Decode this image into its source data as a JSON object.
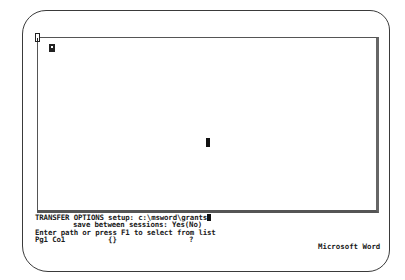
{
  "app": {
    "name": "Microsoft Word"
  },
  "command": {
    "menu": "TRANSFER OPTIONS",
    "field1_label": "setup:",
    "field1_value": "c:\\msword\\grants",
    "field2_label": "save between sessions:",
    "field2_value": "Yes(No)"
  },
  "message": "Enter path or press F1 to select from list",
  "status": {
    "position": "Pg1 Co1",
    "indicator_braces": "{}",
    "indicator_help": "?"
  },
  "icons": {
    "window_marker": "window-number-icon",
    "end_mark": "end-of-document-icon",
    "cursor": "text-cursor-icon"
  }
}
